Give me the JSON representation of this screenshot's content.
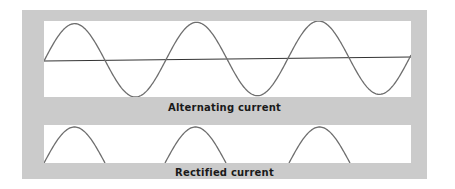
{
  "diagram": {
    "panels": [
      {
        "id": "alternating",
        "caption": "Alternating current"
      },
      {
        "id": "rectified",
        "caption": "Rectified current"
      }
    ],
    "colors": {
      "frame": "#cbcbcb",
      "panel": "#ffffff",
      "wave": "#6e6e6e",
      "axis": "#333333",
      "text": "#1a1a1a"
    }
  }
}
